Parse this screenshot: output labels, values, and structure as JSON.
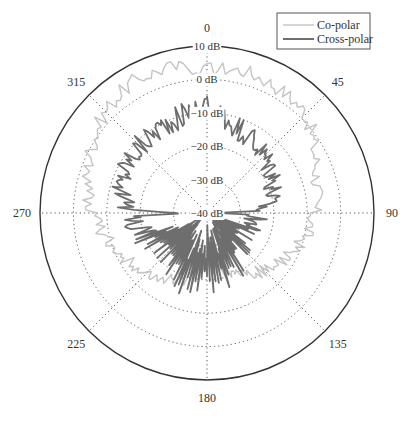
{
  "chart_data": {
    "type": "polar-line",
    "title": "",
    "radial_axis": {
      "unit": "dB",
      "range": [
        -40,
        10
      ],
      "ticks": [
        10,
        0,
        -10,
        -20,
        -30,
        -40
      ],
      "tick_labels": [
        "10 dB",
        "0 dB",
        "−10 dB",
        "−20 dB",
        "−30 dB",
        "−40 dB"
      ]
    },
    "angular_axis": {
      "unit": "deg",
      "direction": "clockwise",
      "zero": "top",
      "ticks": [
        0,
        45,
        90,
        135,
        180,
        225,
        270,
        315
      ],
      "tick_labels": [
        "0",
        "45",
        "90",
        "135",
        "180",
        "225",
        "270",
        "315"
      ]
    },
    "grid": true,
    "legend_position": "top-right",
    "angles_deg": [
      0,
      15,
      30,
      45,
      60,
      75,
      90,
      105,
      120,
      135,
      150,
      165,
      180,
      195,
      210,
      225,
      240,
      255,
      270,
      285,
      300,
      315,
      330,
      345
    ],
    "series": [
      {
        "name": "Co-polar",
        "color": "#c4c4c4",
        "line_width": 1.4,
        "jitter_db": 2.2,
        "values_db": [
          3,
          4,
          3,
          2,
          -3,
          -6,
          -8,
          -10,
          -13,
          -16,
          -18,
          -22,
          -25,
          -20,
          -17,
          -15,
          -12,
          -9,
          -6,
          -3,
          0,
          3,
          5,
          5
        ]
      },
      {
        "name": "Cross-polar",
        "color": "#6e6e6e",
        "line_width": 1.8,
        "jitter_db": 3.5,
        "values_db": [
          -8,
          -12,
          -14,
          -16,
          -17,
          -20,
          -25,
          -26,
          -28,
          -27,
          -24,
          -20,
          -22,
          -18,
          -22,
          -24,
          -22,
          -20,
          -16,
          -14,
          -12,
          -12,
          -11,
          -10
        ]
      }
    ]
  },
  "legend": {
    "items": [
      {
        "label": "Co-polar",
        "color": "#c4c4c4"
      },
      {
        "label": "Cross-polar",
        "color": "#6e6e6e"
      }
    ]
  }
}
